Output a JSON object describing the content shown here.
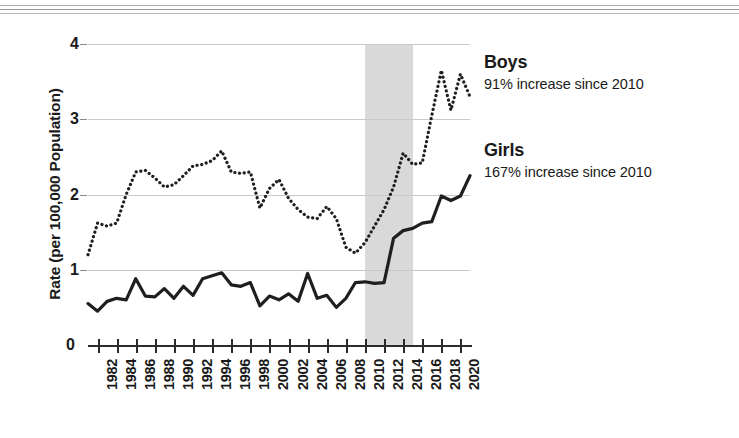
{
  "chart_data": {
    "type": "line",
    "title": "",
    "xlabel": "",
    "ylabel": "Rate (per 100,000 Population)",
    "ylim": [
      0,
      4
    ],
    "xlim": [
      1981,
      2021
    ],
    "grid": true,
    "legend_position": "right",
    "y_ticks": [
      "0",
      "1",
      "2",
      "3",
      "4"
    ],
    "y_tick_values": [
      0,
      1,
      2,
      3,
      4
    ],
    "x_tick_labels": [
      "1982",
      "1984",
      "1986",
      "1988",
      "1990",
      "1992",
      "1994",
      "1996",
      "1998",
      "2000",
      "2002",
      "2004",
      "2006",
      "2008",
      "2010",
      "2012",
      "2014",
      "2016",
      "2018",
      "2020"
    ],
    "x_tick_values": [
      1982,
      1984,
      1986,
      1988,
      1990,
      1992,
      1994,
      1996,
      1998,
      2000,
      2002,
      2004,
      2006,
      2008,
      2010,
      2012,
      2014,
      2016,
      2018,
      2020
    ],
    "x": [
      1981,
      1982,
      1983,
      1984,
      1985,
      1986,
      1987,
      1988,
      1989,
      1990,
      1991,
      1992,
      1993,
      1994,
      1995,
      1996,
      1997,
      1998,
      1999,
      2000,
      2001,
      2002,
      2003,
      2004,
      2005,
      2006,
      2007,
      2008,
      2009,
      2010,
      2011,
      2012,
      2013,
      2014,
      2015,
      2016,
      2017,
      2018,
      2019,
      2020,
      2021
    ],
    "series": [
      {
        "name": "Boys",
        "style": "dotted",
        "color": "#1f1f1f",
        "annotation": "91% increase since 2010",
        "values": [
          1.2,
          1.62,
          1.58,
          1.62,
          2.0,
          2.3,
          2.32,
          2.22,
          2.1,
          2.13,
          2.25,
          2.38,
          2.4,
          2.45,
          2.58,
          2.3,
          2.28,
          2.3,
          1.82,
          2.08,
          2.2,
          1.95,
          1.8,
          1.7,
          1.68,
          1.84,
          1.68,
          1.3,
          1.22,
          1.36,
          1.58,
          1.8,
          2.1,
          2.55,
          2.4,
          2.42,
          3.05,
          3.65,
          3.12,
          3.6,
          3.3
        ]
      },
      {
        "name": "Girls",
        "style": "solid",
        "color": "#1f1f1f",
        "annotation": "167% increase since 2010",
        "values": [
          0.55,
          0.45,
          0.58,
          0.62,
          0.6,
          0.88,
          0.65,
          0.64,
          0.75,
          0.62,
          0.78,
          0.66,
          0.88,
          0.92,
          0.96,
          0.8,
          0.78,
          0.83,
          0.52,
          0.65,
          0.6,
          0.68,
          0.58,
          0.95,
          0.62,
          0.66,
          0.5,
          0.62,
          0.83,
          0.84,
          0.82,
          0.83,
          1.42,
          1.52,
          1.55,
          1.62,
          1.64,
          1.98,
          1.92,
          1.98,
          2.25
        ]
      }
    ],
    "shaded_region": {
      "label": "",
      "x_start": 2010,
      "x_end": 2015,
      "color": "#d9d9d9"
    }
  },
  "legend": {
    "boys": {
      "title": "Boys",
      "subtitle": "91% increase since 2010"
    },
    "girls": {
      "title": "Girls",
      "subtitle": "167% increase since 2010"
    }
  },
  "axes": {
    "y_title": "Rate (per 100,000 Population)",
    "y_zero_label": "0"
  }
}
